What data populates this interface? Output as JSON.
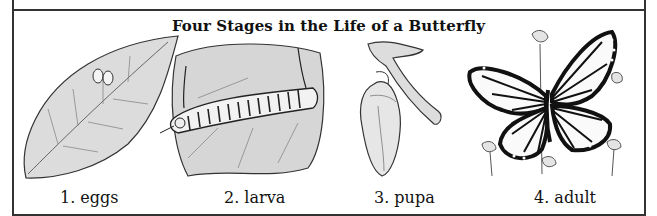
{
  "figure": {
    "title": "Four Stages in the Life of a Butterfly",
    "stages": [
      {
        "number": "1.",
        "name": "eggs",
        "label": "1. eggs",
        "icon": "leaf-with-eggs-icon"
      },
      {
        "number": "2.",
        "name": "larva",
        "label": "2. larva",
        "icon": "caterpillar-on-leaf-icon"
      },
      {
        "number": "3.",
        "name": "pupa",
        "label": "3. pupa",
        "icon": "chrysalis-on-branch-icon"
      },
      {
        "number": "4.",
        "name": "adult",
        "label": "4. adult",
        "icon": "monarch-butterfly-icon"
      }
    ]
  },
  "colors": {
    "ink": "#222222",
    "leaf": "#d9d9d9",
    "background": "#ffffff"
  }
}
